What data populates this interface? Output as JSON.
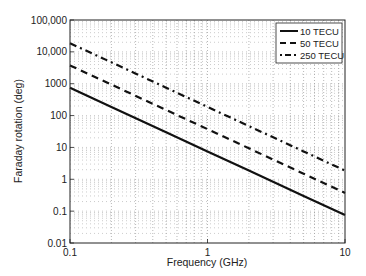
{
  "chart_data": {
    "type": "line",
    "title": "",
    "xlabel": "Frequency (GHz)",
    "ylabel": "Faraday rotation (deg)",
    "xscale": "log",
    "yscale": "log",
    "xlim": [
      0.1,
      10
    ],
    "ylim": [
      0.01,
      100000
    ],
    "xticks": [
      0.1,
      1,
      10
    ],
    "xtick_labels": [
      "0.1",
      "1",
      "10"
    ],
    "yticks": [
      0.01,
      0.1,
      1,
      10,
      100,
      1000,
      10000,
      100000
    ],
    "ytick_labels": [
      "0.01",
      "0.1",
      "1",
      "10",
      "100",
      "1000",
      "10,000",
      "100,000"
    ],
    "grid": true,
    "legend_position": "upper right",
    "x": [
      0.1,
      0.2,
      0.5,
      1,
      2,
      5,
      10
    ],
    "series": [
      {
        "name": "10 TECU",
        "style": "solid",
        "values": [
          750,
          187.5,
          30,
          7.5,
          1.875,
          0.3,
          0.075
        ]
      },
      {
        "name": "50 TECU",
        "style": "dashed",
        "values": [
          3750,
          937.5,
          150,
          37.5,
          9.375,
          1.5,
          0.375
        ]
      },
      {
        "name": "250 TECU",
        "style": "dash-dot",
        "values": [
          18750,
          4687.5,
          750,
          187.5,
          46.875,
          7.5,
          1.875
        ]
      }
    ]
  }
}
